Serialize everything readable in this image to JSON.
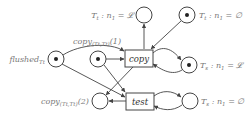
{
  "diagram": {
    "type": "petri-net",
    "places": [
      {
        "id": "p_tt_L",
        "label": "T_t : n_1 = 𝓛",
        "label_main": "T",
        "label_sub": "t",
        "label_rest": " : n",
        "label_sub2": "1",
        "label_tail": " = 𝓛",
        "tokens": 0
      },
      {
        "id": "p_tt_empty",
        "label": "T_t : n_1 = ∅",
        "label_main": "T",
        "label_sub": "t",
        "label_rest": " : n",
        "label_sub2": "1",
        "label_tail": " = ∅",
        "tokens": 1
      },
      {
        "id": "p_flushed",
        "label": "flushed_{T_t}",
        "label_main": "flushed",
        "label_sub": "Tt",
        "tokens": 1
      },
      {
        "id": "p_copy1",
        "label": "copy_(T_t,T_t)(1)",
        "label_main": "copy",
        "label_sub": "(Tt,Tt)",
        "label_tail": "(1)",
        "tokens": 1
      },
      {
        "id": "p_ts_L",
        "label": "T_s : n_1 = 𝓛",
        "label_main": "T",
        "label_sub": "s",
        "label_rest": " : n",
        "label_sub2": "1",
        "label_tail": " = 𝓛",
        "tokens": 1
      },
      {
        "id": "p_copy2",
        "label": "copy_(T_t,T_t)(2)",
        "label_main": "copy",
        "label_sub": "(Tt,Tt)",
        "label_tail": "(2)",
        "tokens": 0
      },
      {
        "id": "p_ts_empty",
        "label": "T_s : n_1 = ∅",
        "label_main": "T",
        "label_sub": "s",
        "label_rest": " : n",
        "label_sub2": "1",
        "label_tail": " = ∅",
        "tokens": 0
      }
    ],
    "transitions": [
      {
        "id": "t_copy",
        "label": "copy"
      },
      {
        "id": "t_test",
        "label": "test"
      }
    ],
    "arcs": [
      {
        "from": "p_flushed",
        "to": "t_copy"
      },
      {
        "from": "p_copy1",
        "to": "t_copy"
      },
      {
        "from": "p_tt_empty",
        "to": "t_copy"
      },
      {
        "from": "t_copy",
        "to": "p_tt_L"
      },
      {
        "from": "t_copy",
        "to": "p_ts_L"
      },
      {
        "from": "p_ts_L",
        "to": "t_copy"
      },
      {
        "from": "t_copy",
        "to": "p_copy2"
      },
      {
        "from": "p_flushed",
        "to": "t_test"
      },
      {
        "from": "p_copy1",
        "to": "t_test"
      },
      {
        "from": "t_test",
        "to": "p_copy2"
      },
      {
        "from": "t_test",
        "to": "p_ts_empty"
      },
      {
        "from": "p_ts_empty",
        "to": "t_test"
      }
    ]
  }
}
